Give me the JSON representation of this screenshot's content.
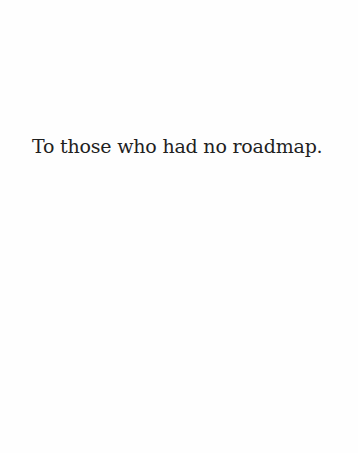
{
  "page": {
    "type": "dedication",
    "text": "To those who had no roadmap.",
    "background_color": "#fefefe",
    "text_color": "#1f1f1f"
  }
}
